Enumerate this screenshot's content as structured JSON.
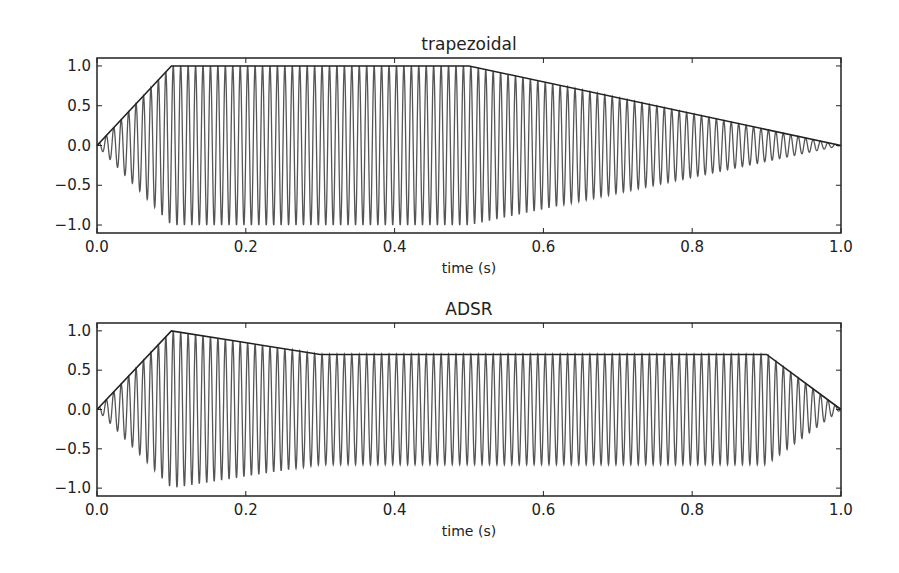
{
  "chart_data": [
    {
      "type": "line",
      "title": "trapezoidal",
      "xlabel": "time (s)",
      "ylabel": "",
      "xlim": [
        0.0,
        1.0
      ],
      "ylim": [
        -1.1,
        1.1
      ],
      "xticks": [
        0.0,
        0.2,
        0.4,
        0.6,
        0.8,
        1.0
      ],
      "xtick_labels": [
        "0.0",
        "0.2",
        "0.4",
        "0.6",
        "0.8",
        "1.0"
      ],
      "yticks": [
        1.0,
        0.5,
        0.0,
        -0.5,
        -1.0
      ],
      "ytick_labels": [
        "1.0",
        "0.5",
        "0.0",
        "−0.5",
        "−1.0"
      ],
      "grid": false,
      "signal": {
        "waveform": "sine",
        "frequency_hz": 100,
        "duration_s": 1.0
      },
      "series": [
        {
          "name": "envelope",
          "x": [
            0.0,
            0.1,
            0.5,
            1.0
          ],
          "y": [
            0.0,
            1.0,
            1.0,
            0.0
          ],
          "color": "#222222"
        },
        {
          "name": "modulated sine",
          "color": "#555555"
        }
      ]
    },
    {
      "type": "line",
      "title": "ADSR",
      "xlabel": "time (s)",
      "ylabel": "",
      "xlim": [
        0.0,
        1.0
      ],
      "ylim": [
        -1.1,
        1.1
      ],
      "xticks": [
        0.0,
        0.2,
        0.4,
        0.6,
        0.8,
        1.0
      ],
      "xtick_labels": [
        "0.0",
        "0.2",
        "0.4",
        "0.6",
        "0.8",
        "1.0"
      ],
      "yticks": [
        1.0,
        0.5,
        0.0,
        -0.5,
        -1.0
      ],
      "ytick_labels": [
        "1.0",
        "0.5",
        "0.0",
        "−0.5",
        "−1.0"
      ],
      "grid": false,
      "signal": {
        "waveform": "sine",
        "frequency_hz": 100,
        "duration_s": 1.0
      },
      "series": [
        {
          "name": "envelope",
          "x": [
            0.0,
            0.1,
            0.3,
            0.9,
            1.0
          ],
          "y": [
            0.0,
            1.0,
            0.7,
            0.7,
            0.0
          ],
          "color": "#222222"
        },
        {
          "name": "modulated sine",
          "color": "#555555"
        }
      ]
    }
  ],
  "layout": {
    "panels": [
      {
        "left": 97,
        "top": 58,
        "width": 744,
        "height": 175
      },
      {
        "left": 97,
        "top": 323,
        "width": 744,
        "height": 173
      }
    ]
  }
}
